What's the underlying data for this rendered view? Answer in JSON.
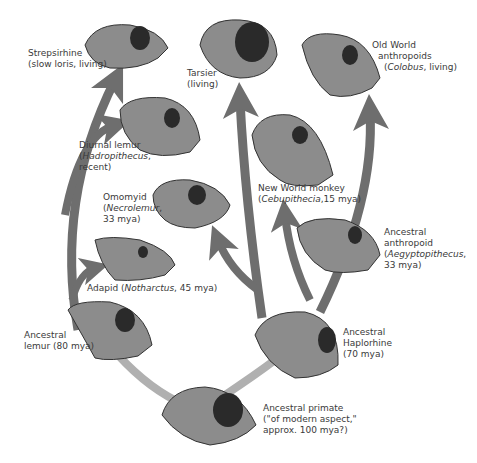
{
  "diagram": {
    "type": "phylogenetic tree of primate skulls",
    "colors": {
      "dark_arrow": "#6e6e6e",
      "light_branch": "#b0b0b0",
      "skull_fill": "#8c8c8c",
      "skull_dark": "#2a2a2a",
      "text": "#3a3a3a"
    },
    "nodes": [
      {
        "id": "strepsirhine",
        "line1": "Strepsirhine",
        "line2": "(slow loris, living)"
      },
      {
        "id": "tarsier",
        "line1": "Tarsier",
        "line2": "(living)"
      },
      {
        "id": "old-world",
        "line1": "Old World",
        "line2": "anthropoids",
        "line3_italic": "Colobus",
        "line3_rest": ", living)",
        "line3_open": "("
      },
      {
        "id": "diurnal-lemur",
        "line1": "Diurnal lemur",
        "line2_open": "(",
        "line2_italic": "Hadropithecus",
        "line2_rest": ",",
        "line3": "recent)"
      },
      {
        "id": "new-world",
        "line1": "New World monkey",
        "line2_open": "(",
        "line2_italic": "Cebupithecia",
        "line2_rest": ",15 mya)"
      },
      {
        "id": "omomyid",
        "line1": "Omomyid",
        "line2_open": "(",
        "line2_italic": "Necrolemur",
        "line2_rest": ",",
        "line3": "33 mya)"
      },
      {
        "id": "ancestral-anthropoid",
        "line1": "Ancestral",
        "line2": "anthropoid",
        "line3_open": "(",
        "line3_italic": "Aegyptopithecus",
        "line3_rest": ",",
        "line4": "33 mya)"
      },
      {
        "id": "adapid",
        "line1_pre": "Adapid (",
        "line1_italic": "Notharctus",
        "line1_rest": ", 45 mya)"
      },
      {
        "id": "ancestral-lemur",
        "line1": "Ancestral",
        "line2": "lemur (80 mya)"
      },
      {
        "id": "ancestral-haplorhine",
        "line1": "Ancestral",
        "line2": "Haplorhine",
        "line3": "(70 mya)"
      },
      {
        "id": "ancestral-primate",
        "line1": "Ancestral primate",
        "line2": "(\"of modern aspect,\"",
        "line3": "approx. 100 mya?)"
      }
    ]
  }
}
